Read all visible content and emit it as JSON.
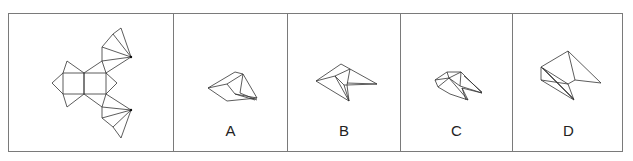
{
  "puzzle": {
    "question_figure": {
      "name": "unfolded-net",
      "description": "net of a polyhedron: two squares with triangles and two triangle fans"
    },
    "options": [
      {
        "label": "A"
      },
      {
        "label": "B"
      },
      {
        "label": "C"
      },
      {
        "label": "D"
      }
    ]
  }
}
